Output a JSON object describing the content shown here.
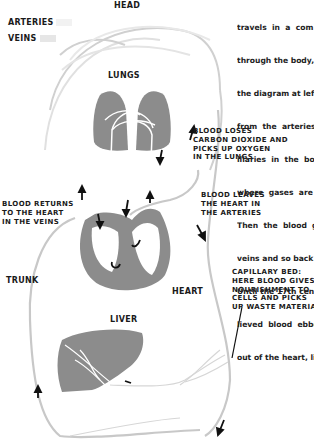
{
  "legend": {
    "arteries_label": "ARTERIES",
    "veins_label": "VEINS",
    "arteries_color": "#f4f4f4",
    "veins_color": "#e2e2e2"
  },
  "organs": {
    "head": "HEAD",
    "lungs": "LUNGS",
    "trunk": "TRUNK",
    "heart": "HEART",
    "liver": "LIVER"
  },
  "captions": {
    "lungs_exchange": "BLOOD LOSES\nCARBON DIOXIDE AND\nPICKS UP OXYGEN\nIN THE LUNGS",
    "arteries_leave": "BLOOD LEAVES\nTHE HEART IN\nTHE ARTERIES",
    "veins_return": "BLOOD RETURNS\nTO THE HEART\nIN THE VEINS",
    "capillary_bed": "CAPILLARY BED:\nHERE BLOOD GIVES\nNOURISHMENT TO\nCELLS AND PICKS\nUP WASTE MATERIAL"
  },
  "prose_lines": [
    "travels  in  a  com",
    "through the body, a",
    "the diagram at left.",
    "from  the  arteries  t",
    "illaries  in  the  bo",
    "where  gases  are",
    "Then  the  blood  go",
    "veins and so back t",
    "Until the 17th centu",
    "lieved  blood  ebbed",
    "out of the heart, like"
  ],
  "colors": {
    "organ_fill": "#8c8c8c",
    "vessel_stroke": "#c8c8c8",
    "arrow": "#111111",
    "text": "#1a1a1a"
  }
}
